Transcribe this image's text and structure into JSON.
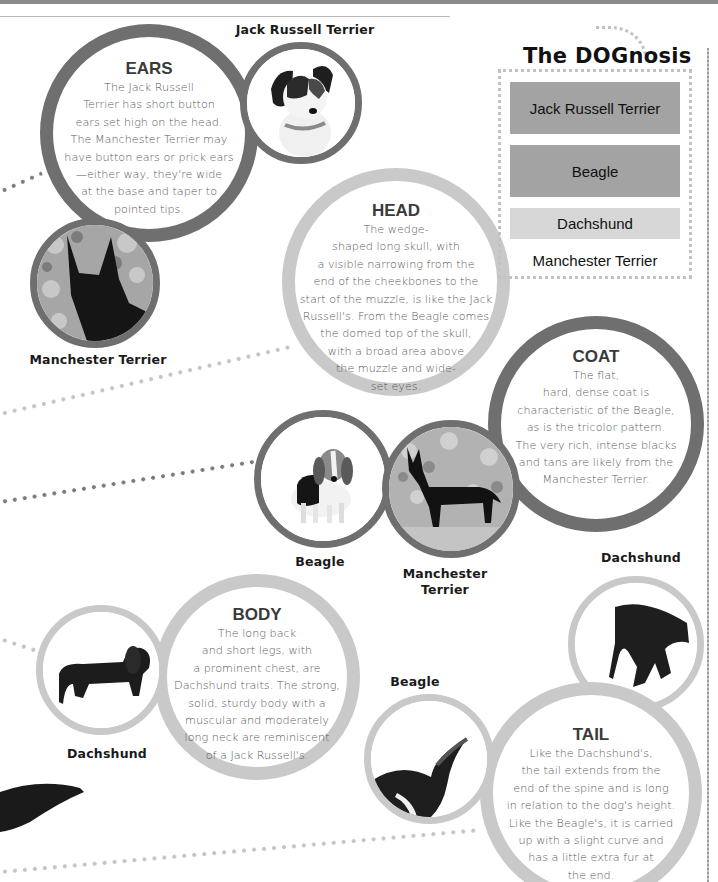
{
  "page": {
    "decor": {
      "ring_dark": "#6f6f6f",
      "ring_light": "#c9c9c9",
      "legend_bar_dark": "#a3a3a3",
      "legend_bar_light": "#d7d7d7"
    }
  },
  "legend": {
    "title": "The DOGnosis",
    "items": [
      {
        "label": "Jack Russell Terrier",
        "shade": "dark"
      },
      {
        "label": "Beagle",
        "shade": "dark"
      },
      {
        "label": "Dachshund",
        "shade": "light"
      },
      {
        "label": "Manchester Terrier",
        "shade": "none"
      }
    ]
  },
  "traits": {
    "ears": {
      "title": "EARS",
      "text": "The Jack Russell\nTerrier has short button\nears set high on the head.\nThe Manchester Terrier may\nhave button ears or prick ears\n—either way, they're wide\nat the base and taper to\npointed tips."
    },
    "head": {
      "title": "HEAD",
      "text": "The wedge-\nshaped long skull, with\na visible narrowing from the\nend of the cheekbones to the\nstart of the muzzle, is like the Jack\nRussell's. From the Beagle comes\nthe domed top of the skull,\nwith a broad area above\nthe muzzle and wide-\nset eyes."
    },
    "coat": {
      "title": "COAT",
      "text": "The flat,\nhard, dense coat is\ncharacteristic of the Beagle,\nas is the tricolor pattern.\nThe very rich, intense blacks\nand tans are likely from the\nManchester Terrier."
    },
    "body": {
      "title": "BODY",
      "text": "The long back\nand short legs, with\na prominent chest, are\nDachshund traits. The strong,\nsolid, sturdy body with a\nmuscular and moderately\nlong neck are reminiscent\nof a Jack Russell's."
    },
    "tail": {
      "title": "TAIL",
      "text": "Like the Dachshund's,\nthe tail extends from the\nend of the spine and is long\nin relation to the dog's height.\nLike the Beagle's, it is carried\nup with a slight curve and\nhas a little extra fur at\nthe end."
    }
  },
  "photos": {
    "jrt_ears": {
      "caption": "Jack Russell Terrier"
    },
    "mt_ears": {
      "caption": "Manchester Terrier"
    },
    "beagle_coat": {
      "caption": "Beagle"
    },
    "mt_coat": {
      "caption": "Manchester\nTerrier"
    },
    "dachshund_body": {
      "caption": "Dachshund"
    },
    "dachshund_tail": {
      "caption": "Dachshund"
    },
    "beagle_tail": {
      "caption": "Beagle"
    }
  }
}
